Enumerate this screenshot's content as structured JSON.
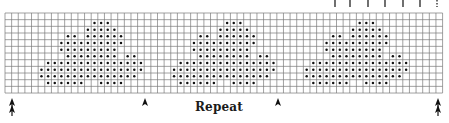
{
  "figure": {
    "type": "knitting-chart",
    "repeat_label": "Repeat",
    "colors": {
      "grid_line": "#7a7a7a",
      "dot": "#111111",
      "arrow": "#111111",
      "background": "#ffffff"
    }
  },
  "grid": {
    "x": 5,
    "y": 13,
    "columns": 66,
    "rows": 12,
    "cell_width": 6.63,
    "cell_height": 6.67
  },
  "motif": {
    "repeat_every_columns": 20,
    "instances_start_columns": [
      0,
      20,
      40
    ],
    "rows": [
      {
        "row": 1,
        "cols": [
          13,
          14,
          15
        ]
      },
      {
        "row": 2,
        "cols": [
          12,
          13,
          14,
          15,
          16
        ]
      },
      {
        "row": 3,
        "cols": [
          9,
          10,
          12,
          13,
          14,
          15,
          16,
          17
        ]
      },
      {
        "row": 4,
        "cols": [
          8,
          9,
          10,
          11,
          12,
          13,
          14,
          15,
          16,
          17
        ]
      },
      {
        "row": 5,
        "cols": [
          8,
          9,
          10,
          11,
          12,
          13,
          14,
          15,
          16
        ]
      },
      {
        "row": 6,
        "cols": [
          9,
          10,
          11,
          12,
          13,
          14,
          15,
          16,
          18,
          19
        ]
      },
      {
        "row": 7,
        "cols": [
          6,
          7,
          8,
          9,
          10,
          11,
          12,
          13,
          14,
          15,
          16,
          17,
          18,
          19,
          20
        ]
      },
      {
        "row": 8,
        "cols": [
          5,
          6,
          7,
          8,
          9,
          10,
          11,
          12,
          13,
          14,
          15,
          16,
          17,
          18,
          19,
          20
        ]
      },
      {
        "row": 9,
        "cols": [
          5,
          6,
          7,
          8,
          9,
          10,
          11,
          12,
          13,
          14,
          15,
          16,
          17,
          18,
          19
        ]
      },
      {
        "row": 10,
        "cols": [
          6,
          7,
          8,
          9,
          10,
          11,
          14,
          15,
          16,
          17
        ]
      }
    ]
  },
  "markers": {
    "bottom_arrows": [
      {
        "x": 12,
        "kind": "double"
      },
      {
        "x": 145,
        "kind": "single"
      },
      {
        "x": 278,
        "kind": "single"
      },
      {
        "x": 438,
        "kind": "double"
      }
    ],
    "top_ticks": [
      {
        "x": 335,
        "kind": "solid"
      },
      {
        "x": 350,
        "kind": "solid"
      },
      {
        "x": 368,
        "kind": "solid"
      },
      {
        "x": 385,
        "kind": "solid"
      },
      {
        "x": 403,
        "kind": "solid"
      },
      {
        "x": 420,
        "kind": "solid"
      },
      {
        "x": 437,
        "kind": "dotted"
      }
    ]
  }
}
